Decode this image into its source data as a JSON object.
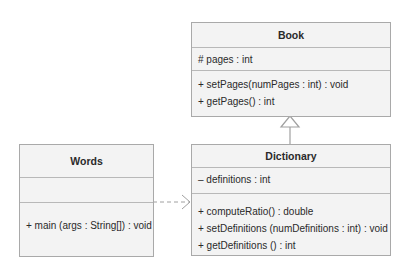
{
  "classes": {
    "book": {
      "name": "Book",
      "attributes": [
        "# pages : int"
      ],
      "methods": [
        "+ setPages(numPages : int) : void",
        "+ getPages() : int"
      ]
    },
    "dictionary": {
      "name": "Dictionary",
      "attributes": [
        "– definitions : int"
      ],
      "methods": [
        "+ computeRatio() : double",
        "+ setDefinitions (numDefinitions : int) : void",
        "+ getDefinitions () : int"
      ]
    },
    "words": {
      "name": "Words",
      "attributes": [],
      "methods": [
        "+ main (args : String[]) : void"
      ]
    }
  },
  "relationships": [
    {
      "type": "generalization",
      "from": "Dictionary",
      "to": "Book"
    },
    {
      "type": "dependency",
      "from": "Words",
      "to": "Dictionary"
    }
  ],
  "colors": {
    "box_fill": "#f3f3f3",
    "box_border": "#a9a9a9",
    "connector": "#a0a0a0"
  }
}
